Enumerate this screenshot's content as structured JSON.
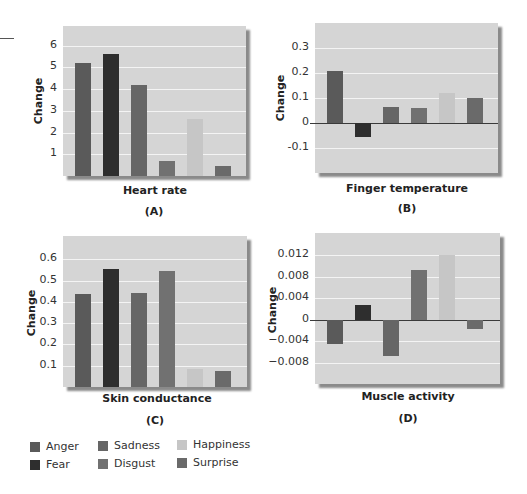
{
  "legend": {
    "items": [
      {
        "label": "Anger",
        "color": "#5a5a5a"
      },
      {
        "label": "Fear",
        "color": "#2e2e2e"
      },
      {
        "label": "Sadness",
        "color": "#666666"
      },
      {
        "label": "Disgust",
        "color": "#717171"
      },
      {
        "label": "Happiness",
        "color": "#c6c6c6"
      },
      {
        "label": "Surprise",
        "color": "#6a6a6a"
      }
    ]
  },
  "chart_data": [
    {
      "type": "bar",
      "panel": "(A)",
      "title": "Heart rate",
      "xlabel": "Heart rate",
      "ylabel": "Change",
      "categories": [
        "Anger",
        "Fear",
        "Sadness",
        "Disgust",
        "Happiness",
        "Surprise"
      ],
      "values": [
        5.2,
        5.6,
        4.2,
        0.7,
        2.6,
        0.45
      ],
      "yticks": [
        1,
        2,
        3,
        4,
        5,
        6
      ],
      "ytick_labels": [
        "1",
        "2",
        "3",
        "4",
        "5",
        "6"
      ],
      "ylim": [
        0,
        6.9
      ],
      "grid": true,
      "legend_position": "bottom-left"
    },
    {
      "type": "bar",
      "panel": "(B)",
      "title": "Finger temperature",
      "xlabel": "Finger temperature",
      "ylabel": "Change",
      "categories": [
        "Anger",
        "Fear",
        "Sadness",
        "Disgust",
        "Happiness",
        "Surprise"
      ],
      "values": [
        0.21,
        -0.055,
        0.065,
        0.06,
        0.12,
        0.1
      ],
      "yticks": [
        -0.1,
        0,
        0.1,
        0.2,
        0.3
      ],
      "ytick_labels": [
        "-0.1",
        "0",
        "0.1",
        "0.2",
        "0.3"
      ],
      "ylim": [
        -0.2,
        0.4
      ],
      "grid": true
    },
    {
      "type": "bar",
      "panel": "(C)",
      "title": "Skin conductance",
      "xlabel": "Skin conductance",
      "ylabel": "Change",
      "categories": [
        "Anger",
        "Fear",
        "Sadness",
        "Disgust",
        "Happiness",
        "Surprise"
      ],
      "values": [
        0.435,
        0.555,
        0.44,
        0.545,
        0.085,
        0.075
      ],
      "yticks": [
        0.1,
        0.2,
        0.3,
        0.4,
        0.5,
        0.6
      ],
      "ytick_labels": [
        "0.1",
        "0.2",
        "0.3",
        "0.4",
        "0.5",
        "0.6"
      ],
      "ylim": [
        0,
        0.71
      ],
      "grid": true
    },
    {
      "type": "bar",
      "panel": "(D)",
      "title": "Muscle activity",
      "xlabel": "Muscle activity",
      "ylabel": "Change",
      "categories": [
        "Anger",
        "Fear",
        "Sadness",
        "Disgust",
        "Happiness",
        "Surprise"
      ],
      "values": [
        -0.0044,
        0.0027,
        -0.0066,
        0.0092,
        0.0121,
        -0.0016
      ],
      "yticks": [
        -0.008,
        -0.004,
        0,
        0.004,
        0.008,
        0.012
      ],
      "ytick_labels": [
        "−0.008",
        "−0.004",
        "0",
        "0.004",
        "0.008",
        "0.012"
      ],
      "ylim": [
        -0.0119,
        0.0161
      ],
      "grid": true
    }
  ]
}
